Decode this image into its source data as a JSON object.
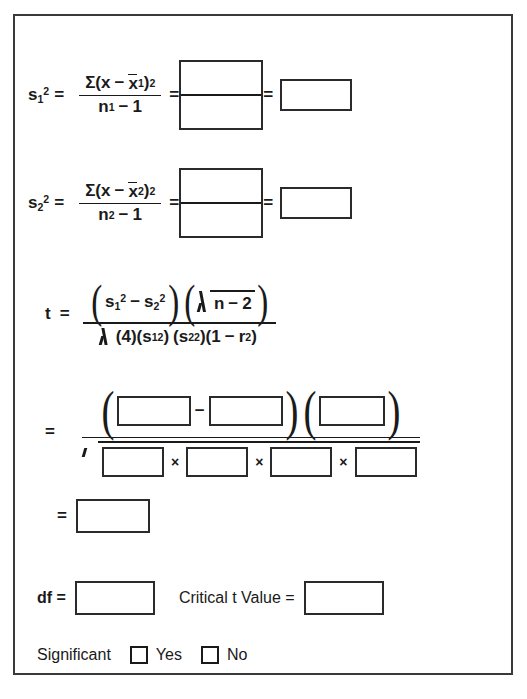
{
  "document": {
    "title": "Two-Sample Variance t-Test Worksheet",
    "border_color": "#3a3a3c",
    "ink_color": "#1a1a1a",
    "background": "#ffffff"
  },
  "glyphs": {
    "equals": "=",
    "minus": "−",
    "times": "×",
    "sigma": "Σ",
    "paren_open": "(",
    "paren_close": ")",
    "one": "1",
    "two": "2",
    "four": "4"
  },
  "formulas": {
    "variance1": {
      "lhs_base": "s",
      "lhs_sub": "1",
      "lhs_sup": "2",
      "numerator": {
        "sigma": "Σ",
        "open": "(",
        "x": "x",
        "minus": "−",
        "xbar": "x",
        "xbar_sub": "1",
        "close": ")",
        "sup": "2"
      },
      "denominator": {
        "n": "n",
        "n_sub": "1",
        "minus": "−",
        "one": "1"
      },
      "blank_numerator": "",
      "blank_denominator": "",
      "blank_result": ""
    },
    "variance2": {
      "lhs_base": "s",
      "lhs_sub": "2",
      "lhs_sup": "2",
      "numerator": {
        "sigma": "Σ",
        "open": "(",
        "x": "x",
        "minus": "−",
        "xbar": "x",
        "xbar_sub": "2",
        "close": ")",
        "sup": "2"
      },
      "denominator": {
        "n": "n",
        "n_sub": "2",
        "minus": "−",
        "one": "1"
      },
      "blank_numerator": "",
      "blank_denominator": "",
      "blank_result": ""
    },
    "t_statistic": {
      "lhs": "t",
      "numerator": {
        "s1_base": "s",
        "s1_sub": "1",
        "s1_sup": "2",
        "minus": "−",
        "s2_base": "s",
        "s2_sub": "2",
        "s2_sup": "2",
        "radicand_n": "n",
        "radicand_minus": "−",
        "radicand_two": "2"
      },
      "denominator": {
        "four": "(4)",
        "s1_open": "(s",
        "s1_sub": "1",
        "s1_sup": "2",
        "s1_close": ")",
        "s2_open": "(s",
        "s2_sub": "2",
        "s2_sup": "2",
        "s2_close": ")",
        "last_open": "(1",
        "last_minus": "−",
        "r": "r",
        "r_sup": "2",
        "last_close": ")"
      }
    },
    "substitution": {
      "lhs": "=",
      "numerator_blanks": [
        "",
        "",
        ""
      ],
      "numerator_minus": "−",
      "denominator_blanks": [
        "",
        "",
        "",
        ""
      ],
      "denominator_times": "×"
    },
    "result": {
      "lhs": "=",
      "blank": ""
    }
  },
  "answers": {
    "df_label": "df  =",
    "df_blank": "",
    "critical_label": "Critical t Value  =",
    "critical_blank": "",
    "significant_label": "Significant",
    "yes_label": "Yes",
    "no_label": "No",
    "yes_checked": false,
    "no_checked": false
  }
}
